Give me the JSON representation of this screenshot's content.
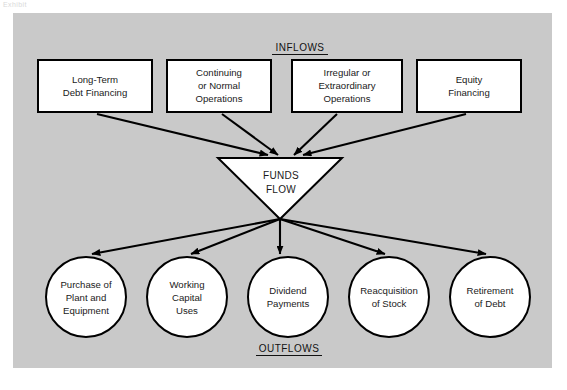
{
  "figure": {
    "corner_caption": "Exhibit",
    "panel_color": "#c9c9c9",
    "page_color": "#ffffff",
    "line_color": "#000000",
    "shape_fill": "#ffffff"
  },
  "sections": {
    "inflows_label": "INFLOWS",
    "outflows_label": "OUTFLOWS"
  },
  "funnel": {
    "line1": "FUNDS",
    "line2": "FLOW"
  },
  "inflows": [
    {
      "id": "long-term-debt-financing",
      "lines": [
        "Long-Term",
        "Debt Financing"
      ],
      "x": 38,
      "y": 60,
      "w": 114,
      "h": 52
    },
    {
      "id": "continuing-or-normal-operations",
      "lines": [
        "Continuing",
        "or Normal",
        "Operations"
      ],
      "x": 167,
      "y": 60,
      "w": 104,
      "h": 52
    },
    {
      "id": "irregular-or-extraordinary-operations",
      "lines": [
        "Irregular or",
        "Extraordinary",
        "Operations"
      ],
      "x": 292,
      "y": 60,
      "w": 110,
      "h": 52
    },
    {
      "id": "equity-financing",
      "lines": [
        "Equity",
        "Financing"
      ],
      "x": 417,
      "y": 60,
      "w": 104,
      "h": 52
    }
  ],
  "outflows": [
    {
      "id": "purchase-of-plant-and-equipment",
      "lines": [
        "Purchase of",
        "Plant and",
        "Equipment"
      ],
      "cx": 86,
      "cy": 297,
      "r": 40
    },
    {
      "id": "working-capital-uses",
      "lines": [
        "Working",
        "Capital",
        "Uses"
      ],
      "cx": 187,
      "cy": 297,
      "r": 40
    },
    {
      "id": "dividend-payments",
      "lines": [
        "Dividend",
        "Payments"
      ],
      "cx": 288,
      "cy": 297,
      "r": 40
    },
    {
      "id": "reacquisition-of-stock",
      "lines": [
        "Reacquisition",
        "of Stock"
      ],
      "cx": 389,
      "cy": 297,
      "r": 40
    },
    {
      "id": "retirement-of-debt",
      "lines": [
        "Retirement",
        "of Debt"
      ],
      "cx": 490,
      "cy": 297,
      "r": 40
    }
  ]
}
